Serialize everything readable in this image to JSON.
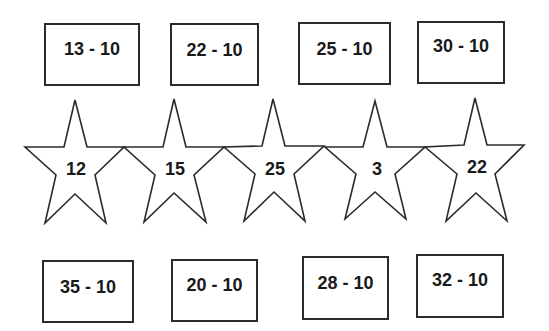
{
  "top_cards": [
    {
      "label": "13 - 10"
    },
    {
      "label": "22 - 10"
    },
    {
      "label": "25 - 10"
    },
    {
      "label": "30 - 10"
    }
  ],
  "stars": [
    {
      "label": "12"
    },
    {
      "label": "15"
    },
    {
      "label": "25"
    },
    {
      "label": "3"
    },
    {
      "label": "22"
    }
  ],
  "bottom_cards": [
    {
      "label": "35 - 10"
    },
    {
      "label": "20 - 10"
    },
    {
      "label": "28 - 10"
    },
    {
      "label": "32 - 10"
    }
  ],
  "colors": {
    "stroke": "#2b2b2b",
    "text": "#1a1a1a",
    "background": "#ffffff"
  }
}
